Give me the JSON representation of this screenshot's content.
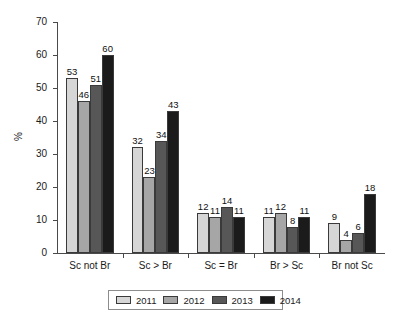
{
  "chart_data": {
    "type": "bar",
    "title": "",
    "xlabel": "",
    "ylabel": "%",
    "ylim": [
      0,
      70
    ],
    "yticks": [
      0,
      10,
      20,
      30,
      40,
      50,
      60,
      70
    ],
    "grid": false,
    "legend_position": "bottom",
    "categories": [
      "Sc not Br",
      "Sc > Br",
      "Sc = Br",
      "Br > Sc",
      "Br not Sc"
    ],
    "series": [
      {
        "name": "2011",
        "color": "#d6d6d6",
        "values": [
          53,
          32,
          12,
          11,
          9
        ]
      },
      {
        "name": "2012",
        "color": "#a6a6a6",
        "values": [
          46,
          23,
          11,
          12,
          4
        ]
      },
      {
        "name": "2013",
        "color": "#575757",
        "values": [
          51,
          34,
          14,
          8,
          6
        ]
      },
      {
        "name": "2014",
        "color": "#1b1b1b",
        "values": [
          60,
          43,
          11,
          11,
          18
        ]
      }
    ]
  }
}
